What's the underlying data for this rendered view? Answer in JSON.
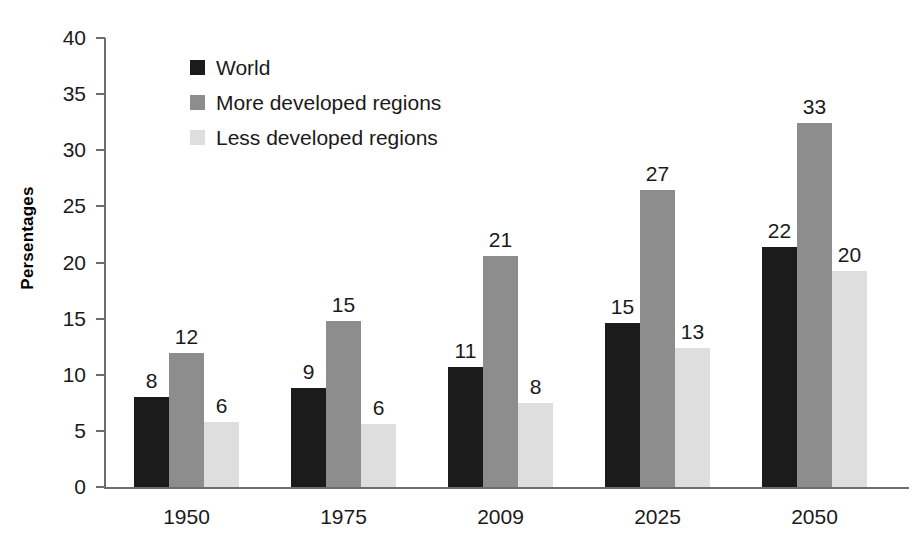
{
  "chart_data": {
    "type": "bar",
    "title": "",
    "subtitle": "",
    "xlabel": "",
    "ylabel": "Persentages",
    "categories": [
      "1950",
      "1975",
      "2009",
      "2025",
      "2050"
    ],
    "ylim": [
      0,
      40
    ],
    "yticks": [
      0,
      5,
      10,
      15,
      20,
      25,
      30,
      35,
      40
    ],
    "ytick_labels": [
      "0",
      "5",
      "10",
      "15",
      "20",
      "25",
      "30",
      "35",
      "40"
    ],
    "grid": false,
    "legend_position": "top-left inside plot",
    "series": [
      {
        "name": "World",
        "color": "#1b1b1b",
        "values": [
          8.0,
          8.8,
          10.7,
          14.6,
          21.4
        ],
        "labels": [
          "8",
          "9",
          "11",
          "15",
          "22"
        ]
      },
      {
        "name": "More developed regions",
        "color": "#8d8d8d",
        "values": [
          11.9,
          14.8,
          20.6,
          26.5,
          32.4
        ],
        "labels": [
          "12",
          "15",
          "21",
          "27",
          "33"
        ]
      },
      {
        "name": "Less developed regions",
        "color": "#dedede",
        "values": [
          5.8,
          5.6,
          7.5,
          12.4,
          19.2
        ],
        "labels": [
          "6",
          "6",
          "8",
          "13",
          "20"
        ]
      }
    ]
  },
  "colors": {
    "background": "#ffffff",
    "axis": "#6d6d6d",
    "text": "#1a1a1a",
    "series_world": "#1b1b1b",
    "series_more_developed": "#8d8d8d",
    "series_less_developed": "#dedede"
  }
}
